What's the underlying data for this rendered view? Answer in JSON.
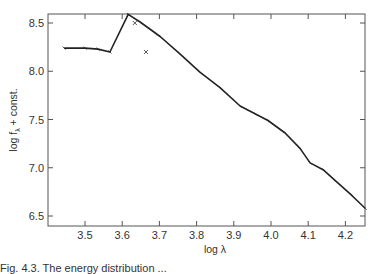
{
  "chart_data": {
    "type": "line",
    "title": "",
    "xlabel": "log λ",
    "ylabel": "log f_λ + const.",
    "xlim": [
      3.39,
      4.254
    ],
    "ylim": [
      6.4,
      8.6
    ],
    "xticks": [
      3.5,
      3.6,
      3.7,
      3.8,
      3.9,
      4.0,
      4.1,
      4.2
    ],
    "xtick_labels": [
      "3.5",
      "3.6",
      "3.7",
      "3.8",
      "3.9",
      "4.0",
      "4.1",
      "4.2"
    ],
    "yticks": [
      6.5,
      7.0,
      7.5,
      8.0,
      8.5
    ],
    "ytick_labels": [
      "6.5",
      "7.0",
      "7.5",
      "8.0",
      "8.5"
    ],
    "grid": false,
    "legend": null,
    "series": [
      {
        "name": "energy distribution",
        "style": "line",
        "x": [
          3.444,
          3.5,
          3.535,
          3.567,
          3.616,
          3.648,
          3.702,
          3.755,
          3.809,
          3.863,
          3.917,
          3.957,
          3.992,
          4.038,
          4.078,
          4.105,
          4.14,
          4.172,
          4.218,
          4.253
        ],
        "y": [
          8.24,
          8.24,
          8.23,
          8.2,
          8.59,
          8.51,
          8.36,
          8.18,
          7.99,
          7.83,
          7.64,
          7.56,
          7.49,
          7.36,
          7.2,
          7.05,
          6.98,
          6.87,
          6.71,
          6.58
        ]
      },
      {
        "name": "markers",
        "style": "x-markers",
        "x": [
          3.634,
          3.664
        ],
        "y": [
          8.5,
          8.2
        ]
      }
    ]
  },
  "axes": {
    "x_label": "log λ",
    "y_label": "log f",
    "y_label_sub": "λ",
    "y_label_suffix": " + const."
  },
  "caption": {
    "text": "Fig. 4.3. The energy distribution ..."
  }
}
